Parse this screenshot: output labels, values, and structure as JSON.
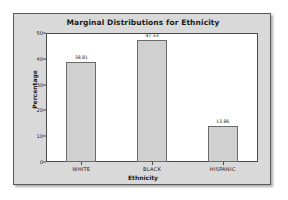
{
  "panel": {
    "background_color": "#d9d9d9",
    "border_color": "#5a5a5a",
    "plot_background_color": "#ffffff"
  },
  "chart_data": {
    "type": "bar",
    "title": "Marginal Distributions for Ethnicity",
    "xlabel": "Ethnicity",
    "ylabel": "Percentage",
    "categories": [
      "WHITE",
      "BLACK",
      "HISPANIC"
    ],
    "values": [
      38.81,
      47.33,
      13.86
    ],
    "value_labels": [
      "38.81",
      "47.33",
      "13.86"
    ],
    "ylim": [
      0,
      50
    ],
    "yticks": [
      0,
      10,
      20,
      30,
      40,
      50
    ],
    "ytick_labels": [
      "0",
      "10",
      "20",
      "30",
      "40",
      "50"
    ],
    "grid": false,
    "legend": false,
    "bar_color": "#d0d0d0",
    "bar_edge_color": "#6b6b6b"
  }
}
